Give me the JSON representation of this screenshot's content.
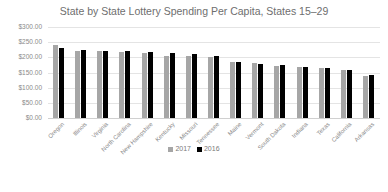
{
  "chart_data": {
    "type": "bar",
    "title": "State by State Lottery Spending Per Capita, States 15–29",
    "xlabel": "",
    "ylabel": "",
    "ylim": [
      0,
      300
    ],
    "yticks": [
      "$300.00",
      "$250.00",
      "$200.00",
      "$150.00",
      "$100.00",
      "$50.00",
      "$0.00"
    ],
    "grid": true,
    "legend_position": "bottom",
    "categories": [
      "Oregon",
      "Illinois",
      "Virginia",
      "North Carolina",
      "New Hampshire",
      "Kentucky",
      "Missouri",
      "Tennessee",
      "Maine",
      "Vermont",
      "South Dakota",
      "Indiana",
      "Texas",
      "California",
      "Arkansas"
    ],
    "series": [
      {
        "name": "2017",
        "color": "#a6a6a6",
        "values": [
          240,
          222,
          220,
          217,
          213,
          205,
          205,
          200,
          185,
          180,
          172,
          168,
          166,
          157,
          138
        ]
      },
      {
        "name": "2016",
        "color": "#000000",
        "values": [
          232,
          225,
          222,
          222,
          216,
          213,
          210,
          205,
          185,
          177,
          175,
          168,
          166,
          157,
          142
        ]
      }
    ]
  }
}
